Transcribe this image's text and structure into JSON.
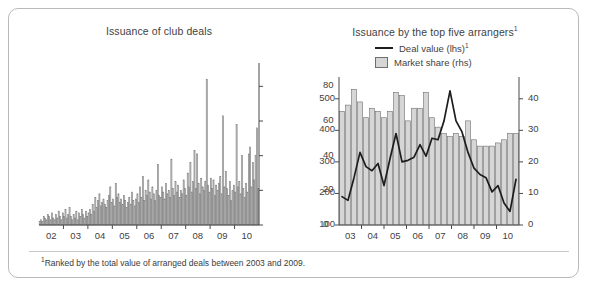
{
  "figure": {
    "footnote_marker": "1",
    "footnote_text": "Ranked by the total value of arranged deals between 2003 and 2009."
  },
  "panels": {
    "left": {
      "title": "Issuance of club deals",
      "y_ticks": [
        "0",
        "20",
        "40",
        "60",
        "80"
      ],
      "x_ticks": [
        "02",
        "03",
        "04",
        "05",
        "06",
        "07",
        "08",
        "09",
        "10"
      ]
    },
    "right": {
      "title": "Issuance by the top five arrangers",
      "title_sup": "1",
      "legend": [
        {
          "label": "Deal value (lhs)",
          "sup": "1",
          "marker": "line",
          "color": "#1d1d1d"
        },
        {
          "label": "Market share (rhs)",
          "sup": "",
          "marker": "box",
          "color": "#d6d6d6"
        }
      ],
      "y_left_ticks": [
        "100",
        "200",
        "300",
        "400",
        "500"
      ],
      "y_right_ticks": [
        "0",
        "10",
        "20",
        "30",
        "40"
      ],
      "x_ticks": [
        "03",
        "04",
        "05",
        "06",
        "07",
        "08",
        "09",
        "10"
      ]
    }
  },
  "chart_data": [
    {
      "type": "bar",
      "title": "Issuance of club deals",
      "xlabel": "",
      "ylabel": "",
      "ylim": [
        0,
        90
      ],
      "grid": false,
      "x_tick_labels": [
        "02",
        "03",
        "04",
        "05",
        "06",
        "07",
        "08",
        "09",
        "10"
      ],
      "x_tick_positions": [
        6,
        18,
        30,
        42,
        54,
        66,
        78,
        90,
        102
      ],
      "frequency": "monthly",
      "series": [
        {
          "name": "Issuance of club deals",
          "color": "#c9c9c9",
          "edge_color": "#6f6f6f",
          "values": [
            2,
            3,
            2,
            5,
            4,
            3,
            6,
            5,
            3,
            7,
            4,
            3,
            6,
            4,
            8,
            5,
            3,
            7,
            5,
            9,
            4,
            6,
            10,
            5,
            3,
            6,
            4,
            8,
            3,
            7,
            5,
            9,
            6,
            4,
            8,
            5,
            7,
            9,
            6,
            12,
            8,
            16,
            10,
            14,
            18,
            11,
            13,
            15,
            12,
            10,
            14,
            17,
            22,
            13,
            15,
            11,
            24,
            16,
            18,
            13,
            15,
            12,
            17,
            14,
            10,
            13,
            16,
            12,
            19,
            14,
            11,
            15,
            18,
            13,
            22,
            16,
            28,
            14,
            20,
            17,
            26,
            19,
            15,
            22,
            18,
            14,
            20,
            35,
            17,
            16,
            22,
            19,
            15,
            24,
            18,
            20,
            16,
            38,
            21,
            17,
            25,
            19,
            23,
            16,
            20,
            18,
            26,
            21,
            17,
            30,
            22,
            36,
            19,
            25,
            43,
            21,
            41,
            24,
            18,
            27,
            22,
            20,
            25,
            84,
            23,
            19,
            27,
            21,
            26,
            17,
            23,
            20,
            24,
            28,
            18,
            63,
            22,
            31,
            21,
            17,
            25,
            14,
            20,
            23,
            19,
            58,
            22,
            25,
            18,
            40,
            21,
            16,
            24,
            19,
            41,
            45,
            22,
            36,
            26,
            40,
            56,
            21
          ]
        }
      ]
    },
    {
      "type": "bar+line",
      "title": "Issuance by the top five arrangers",
      "xlabel": "",
      "ylabel_left": "",
      "ylabel_right": "",
      "ylim_left": [
        100,
        550
      ],
      "ylim_right": [
        0,
        45
      ],
      "grid": false,
      "x_tick_labels": [
        "03",
        "04",
        "05",
        "06",
        "07",
        "08",
        "09",
        "10"
      ],
      "frequency": "quarterly",
      "x_quarters": [
        "2003Q1",
        "2003Q2",
        "2003Q3",
        "2003Q4",
        "2004Q1",
        "2004Q2",
        "2004Q3",
        "2004Q4",
        "2005Q1",
        "2005Q2",
        "2005Q3",
        "2005Q4",
        "2006Q1",
        "2006Q2",
        "2006Q3",
        "2006Q4",
        "2007Q1",
        "2007Q2",
        "2007Q3",
        "2007Q4",
        "2008Q1",
        "2008Q2",
        "2008Q3",
        "2008Q4",
        "2009Q1",
        "2009Q2",
        "2009Q3",
        "2009Q4",
        "2010Q1",
        "2010Q2"
      ],
      "series": [
        {
          "name": "Market share (rhs)",
          "type": "bar",
          "axis": "right",
          "color": "#d6d6d6",
          "edge_color": "#6f6f6f",
          "unit": "%",
          "values": [
            36,
            38,
            43,
            39,
            34,
            37,
            36,
            34,
            36,
            42,
            41,
            33,
            37,
            37,
            42,
            34,
            31,
            29,
            28,
            29,
            28,
            33,
            27,
            25,
            25,
            25,
            26,
            27,
            29,
            29
          ]
        },
        {
          "name": "Deal value (lhs)",
          "type": "line",
          "axis": "left",
          "color": "#1d1d1d",
          "unit": "USD bn",
          "values": [
            190,
            178,
            250,
            330,
            285,
            272,
            295,
            225,
            310,
            390,
            300,
            305,
            315,
            355,
            318,
            375,
            370,
            430,
            525,
            430,
            395,
            330,
            280,
            260,
            250,
            205,
            225,
            170,
            143,
            245
          ]
        }
      ]
    }
  ]
}
